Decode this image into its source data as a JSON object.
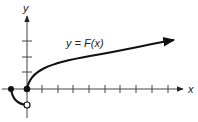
{
  "figure": {
    "x_axis_label": "x",
    "y_axis_label": "y",
    "curve_label": "y = F(x)",
    "colors": {
      "axis": "#444444",
      "curve": "#111111",
      "text": "#222222",
      "background": "#ffffff"
    },
    "x_ticks_count": 9,
    "y_ticks_count": 3,
    "points": [
      {
        "name": "left-endpoint",
        "style": "filled",
        "x": -1,
        "y": 0
      },
      {
        "name": "origin",
        "style": "filled",
        "x": 0,
        "y": 0
      },
      {
        "name": "open-point",
        "style": "open",
        "x": 0,
        "y": -1
      }
    ]
  }
}
